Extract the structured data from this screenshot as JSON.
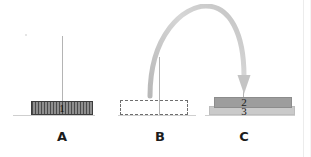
{
  "figure": {
    "background_color": "#ffffff"
  },
  "panels": [
    {
      "id": "a",
      "caption": "A",
      "element_label": "1",
      "element_kind": "hatched-block",
      "element_color": "#4a4a4a",
      "has_pole": true,
      "has_ground": true
    },
    {
      "id": "b",
      "caption": "B",
      "element_label": "",
      "element_kind": "dashed-outline",
      "element_color": "#6e6e6e",
      "has_pole": true,
      "has_ground": true
    },
    {
      "id": "c",
      "caption": "C",
      "element_label_top": "2",
      "element_label_bottom": "3",
      "element_kind": "stacked-bars",
      "bar_top_color": "#9d9d9d",
      "bar_bottom_color": "#cacaca",
      "has_pole": true,
      "has_ground": true
    }
  ],
  "arrow": {
    "name": "curved-transfer-arrow",
    "color": "#c4c4c4",
    "from_panel": "B",
    "to_panel": "C",
    "direction": "down"
  },
  "colors": {
    "ground_line": "#cfcfcf",
    "pole": "#b4b4b4",
    "caption_text": "#1c1c1c",
    "number_text": "#1a1a1a",
    "edge_line": "#ececec"
  }
}
